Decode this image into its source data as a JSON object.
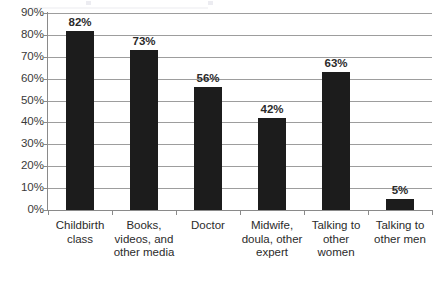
{
  "chart_data": {
    "type": "bar",
    "title": "",
    "xlabel": "",
    "ylabel": "",
    "categories": [
      "Childbirth class",
      "Books, videos, and other media",
      "Doctor",
      "Midwife, doula, other expert",
      "Talking to other women",
      "Talking to other men"
    ],
    "category_lines": [
      [
        "Childbirth",
        "class"
      ],
      [
        "Books,",
        "videos, and",
        "other media"
      ],
      [
        "Doctor"
      ],
      [
        "Midwife,",
        "doula, other",
        "expert"
      ],
      [
        "Talking to",
        "other",
        "women"
      ],
      [
        "Talking to",
        "other men"
      ]
    ],
    "values": [
      82,
      73,
      56,
      42,
      63,
      5
    ],
    "value_labels": [
      "82%",
      "73%",
      "56%",
      "42%",
      "63%",
      "5%"
    ],
    "ylim": [
      0,
      90
    ],
    "ytick_values": [
      0,
      10,
      20,
      30,
      40,
      50,
      60,
      70,
      80,
      90
    ],
    "ytick_labels": [
      "0%",
      "10%",
      "20%",
      "30%",
      "40%",
      "50%",
      "60%",
      "70%",
      "80%",
      "90%"
    ],
    "grid": true,
    "legend": false,
    "bar_color": "#1c1c1c",
    "gridline_color": "#9d9d9d",
    "axis_color": "#8a8a8a",
    "label_color": "#2b2b2b",
    "background_color": "#ffffff"
  }
}
